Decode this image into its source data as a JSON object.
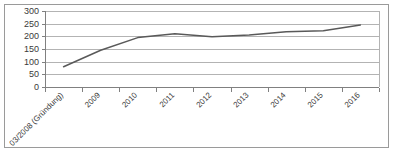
{
  "chart_data": {
    "type": "line",
    "title": "",
    "subtitle": "",
    "xlabel": "",
    "ylabel": "",
    "categories": [
      "03/2008 (Gründung)",
      "2009",
      "2010",
      "2011",
      "2012",
      "2013",
      "2014",
      "2015",
      "2016"
    ],
    "series": [
      {
        "name": "",
        "values": [
          80,
          145,
          195,
          210,
          198,
          205,
          218,
          222,
          245
        ]
      }
    ],
    "ylim": [
      0,
      300
    ],
    "yticks": [
      0,
      50,
      100,
      150,
      200,
      250,
      300
    ],
    "ytick_labels": [
      "0",
      "50",
      "100",
      "150",
      "200",
      "250",
      "300"
    ],
    "grid": true,
    "grid_axis": "y",
    "legend": false,
    "legend_position": "none",
    "markers": false,
    "xtick_rotation_deg": 45,
    "colors": {
      "line": "#595959",
      "grid": "#b3b3b3",
      "axis": "#808080",
      "frame": "#9a9a9a",
      "text": "#3a3a3a",
      "background": "#ffffff"
    }
  }
}
